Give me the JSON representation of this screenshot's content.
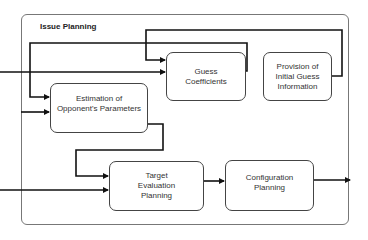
{
  "diagram": {
    "title": "Issue Planning",
    "nodes": [
      {
        "id": "guess-coefficients",
        "lines": [
          "Guess",
          "Coefficients"
        ]
      },
      {
        "id": "provision-initial-guess",
        "lines": [
          "Provision of",
          "Initial Guess",
          "Information"
        ]
      },
      {
        "id": "estimation-opponent",
        "lines": [
          "Estimation of",
          "Opponent's Parameters"
        ]
      },
      {
        "id": "target-evaluation",
        "lines": [
          "Target",
          "Evaluation",
          "Planning"
        ]
      },
      {
        "id": "configuration-planning",
        "lines": [
          "Configuration",
          "Planning"
        ]
      }
    ],
    "edges": [
      {
        "from": "provision-initial-guess",
        "to": "guess-coefficients"
      },
      {
        "from": "guess-coefficients",
        "to": "estimation-opponent"
      },
      {
        "from": "external-input",
        "to": "guess-coefficients"
      },
      {
        "from": "external-input",
        "to": "estimation-opponent"
      },
      {
        "from": "estimation-opponent",
        "to": "target-evaluation"
      },
      {
        "from": "external-input",
        "to": "target-evaluation"
      },
      {
        "from": "target-evaluation",
        "to": "configuration-planning"
      },
      {
        "from": "configuration-planning",
        "to": "external-output"
      }
    ]
  }
}
